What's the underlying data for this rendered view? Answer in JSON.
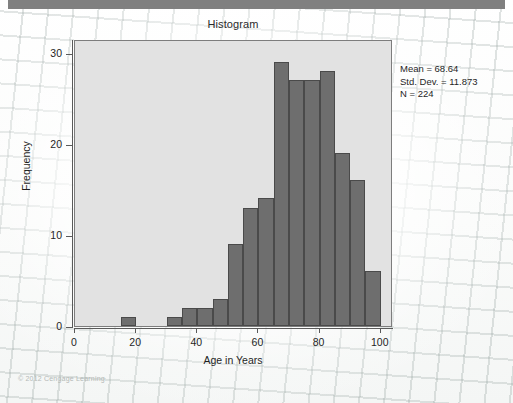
{
  "figure": {
    "copyright": "© 2012 Cengage Learning"
  },
  "chart_data": {
    "type": "bar",
    "title": "Histogram",
    "xlabel": "Age in Years",
    "ylabel": "Frequency",
    "xlim": [
      0,
      104
    ],
    "ylim": [
      0,
      31.5
    ],
    "xticks": [
      0,
      20,
      40,
      60,
      80,
      100
    ],
    "xtick_labels": [
      "0",
      "20",
      "40",
      "60",
      "80",
      "100"
    ],
    "yticks": [
      0,
      10,
      20,
      30
    ],
    "ytick_labels": [
      "0",
      "10",
      "20",
      "30"
    ],
    "grid": false,
    "legend": "none",
    "bin_width": 5,
    "bin_starts": [
      15,
      30,
      35,
      40,
      45,
      50,
      55,
      60,
      65,
      70,
      75,
      80,
      85,
      90
    ],
    "categories": [
      "15-20",
      "30-35",
      "35-40",
      "40-45",
      "45-50",
      "50-55",
      "55-60",
      "60-65",
      "65-70",
      "70-75",
      "75-80",
      "80-85",
      "85-90",
      "90-95"
    ],
    "values": [
      1,
      1,
      2,
      2,
      3,
      9,
      13,
      14,
      29,
      27,
      27,
      28,
      19,
      16
    ],
    "bars": [
      {
        "start": 15,
        "end": 20,
        "value": 1
      },
      {
        "start": 30,
        "end": 35,
        "value": 1
      },
      {
        "start": 35,
        "end": 40,
        "value": 2
      },
      {
        "start": 40,
        "end": 45,
        "value": 2
      },
      {
        "start": 45,
        "end": 50,
        "value": 3
      },
      {
        "start": 50,
        "end": 55,
        "value": 9
      },
      {
        "start": 55,
        "end": 60,
        "value": 13
      },
      {
        "start": 60,
        "end": 65,
        "value": 14
      },
      {
        "start": 65,
        "end": 70,
        "value": 29
      },
      {
        "start": 70,
        "end": 75,
        "value": 27
      },
      {
        "start": 75,
        "end": 80,
        "value": 27
      },
      {
        "start": 80,
        "end": 85,
        "value": 28
      },
      {
        "start": 85,
        "end": 90,
        "value": 19
      },
      {
        "start": 90,
        "end": 95,
        "value": 16
      },
      {
        "start": 95,
        "end": 100,
        "value": 6
      }
    ],
    "annotations": {
      "mean_line": "Mean = 68.64",
      "std_dev_line": "Std. Dev. = 11.873",
      "n_line": "N = 224"
    },
    "colors": {
      "bar_fill": "#6e6e6e",
      "bar_edge": "#4a4a4a",
      "plot_background": "#e2e2e2",
      "axis": "#5a5a5a",
      "text": "#1f1f1f",
      "top_band": "#808080"
    }
  }
}
